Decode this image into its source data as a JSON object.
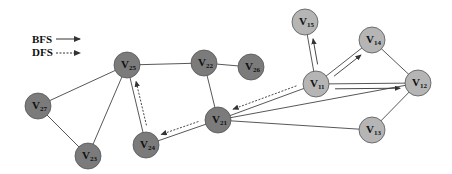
{
  "legend": {
    "items": [
      {
        "label": "BFS",
        "style": "solid"
      },
      {
        "label": "DFS",
        "style": "dashed"
      }
    ]
  },
  "colors": {
    "dark_node": "#7b7b7b",
    "light_node": "#b5b5b5",
    "node_stroke": "#555555",
    "edge": "#444444",
    "arrow": "#333333"
  },
  "nodes": [
    {
      "id": "V25",
      "letter": "V",
      "sub": "25",
      "x": 127,
      "y": 65,
      "shade": "dark"
    },
    {
      "id": "V22",
      "letter": "V",
      "sub": "22",
      "x": 204,
      "y": 63,
      "shade": "dark"
    },
    {
      "id": "V26",
      "letter": "V",
      "sub": "26",
      "x": 251,
      "y": 67,
      "shade": "dark"
    },
    {
      "id": "V27",
      "letter": "V",
      "sub": "27",
      "x": 38,
      "y": 106,
      "shade": "dark"
    },
    {
      "id": "V23",
      "letter": "V",
      "sub": "23",
      "x": 88,
      "y": 156,
      "shade": "dark"
    },
    {
      "id": "V24",
      "letter": "V",
      "sub": "24",
      "x": 146,
      "y": 145,
      "shade": "dark"
    },
    {
      "id": "V21",
      "letter": "V",
      "sub": "21",
      "x": 218,
      "y": 120,
      "shade": "dark"
    },
    {
      "id": "V15",
      "letter": "V",
      "sub": "15",
      "x": 305,
      "y": 22,
      "shade": "light"
    },
    {
      "id": "V14",
      "letter": "V",
      "sub": "14",
      "x": 372,
      "y": 40,
      "shade": "light"
    },
    {
      "id": "V11",
      "letter": "V",
      "sub": "11",
      "x": 316,
      "y": 84,
      "shade": "light"
    },
    {
      "id": "V12",
      "letter": "V",
      "sub": "12",
      "x": 418,
      "y": 83,
      "shade": "light"
    },
    {
      "id": "V13",
      "letter": "V",
      "sub": "13",
      "x": 372,
      "y": 130,
      "shade": "light"
    }
  ],
  "edges": [
    [
      "V27",
      "V25"
    ],
    [
      "V27",
      "V23"
    ],
    [
      "V23",
      "V25"
    ],
    [
      "V25",
      "V22"
    ],
    [
      "V25",
      "V24"
    ],
    [
      "V22",
      "V26"
    ],
    [
      "V22",
      "V21"
    ],
    [
      "V21",
      "V24"
    ],
    [
      "V21",
      "V11"
    ],
    [
      "V21",
      "V12"
    ],
    [
      "V21",
      "V13"
    ],
    [
      "V11",
      "V15"
    ],
    [
      "V11",
      "V14"
    ],
    [
      "V11",
      "V12"
    ],
    [
      "V14",
      "V12"
    ],
    [
      "V12",
      "V13"
    ]
  ],
  "traversal_arrows": [
    {
      "type": "BFS",
      "from": "V11",
      "to": "V15",
      "style": "solid"
    },
    {
      "type": "BFS",
      "from": "V11",
      "to": "V14",
      "style": "solid"
    },
    {
      "type": "BFS",
      "from": "V11",
      "to": "V12",
      "style": "solid"
    },
    {
      "type": "DFS",
      "from": "V11",
      "to": "V21",
      "style": "dashed"
    },
    {
      "type": "DFS",
      "from": "V21",
      "to": "V24",
      "style": "dashed"
    },
    {
      "type": "DFS",
      "from": "V24",
      "to": "V25",
      "style": "dashed"
    }
  ]
}
